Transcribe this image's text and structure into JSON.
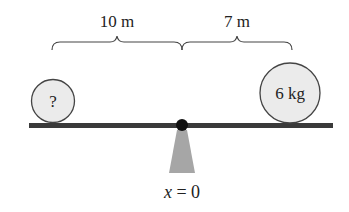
{
  "diagram": {
    "type": "seesaw-torque-balance",
    "labels": {
      "left_distance": "10 m",
      "right_distance": "7 m",
      "left_mass": "?",
      "right_mass": "6 kg",
      "pivot_prefix": "x",
      "pivot_suffix": " = 0"
    },
    "colors": {
      "beam": "#3a3a3a",
      "ball_fill": "#ebebeb",
      "ball_stroke": "#444444",
      "pivot_dot": "#111111",
      "fulcrum": "#a6a6a6",
      "text": "#222222"
    }
  }
}
